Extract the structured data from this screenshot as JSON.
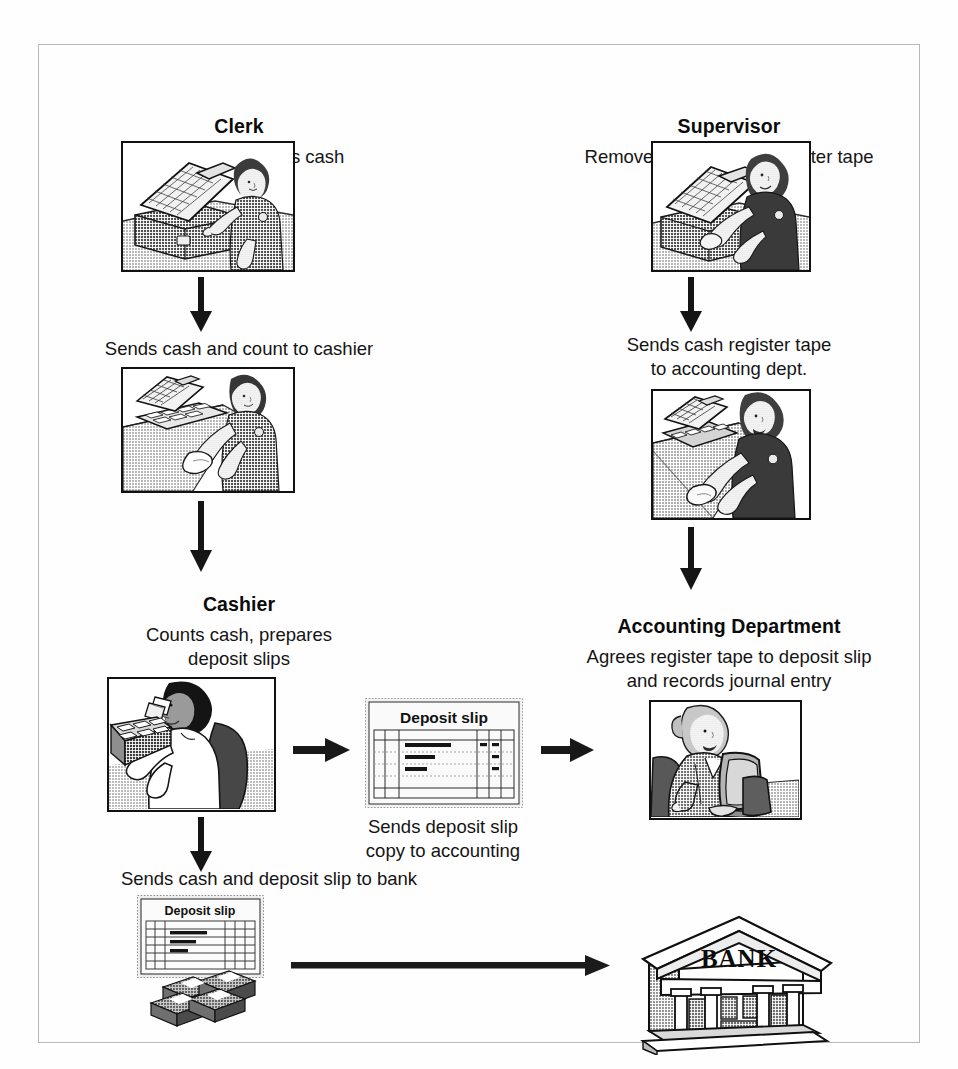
{
  "diagram": {
    "border_color": "#b8b8b8",
    "ink_color": "#0d0d0d",
    "background": "#fefefe"
  },
  "columns": {
    "clerk": {
      "role": "Clerk",
      "duty": "Enters sales, counts cash",
      "step_caption": "Sends cash and count to cashier",
      "image_1_name": "clerk-at-cash-register",
      "image_2_name": "clerk-handing-cash-to-cashier"
    },
    "supervisor": {
      "role": "Supervisor",
      "duty": "Removes locked cash register tape",
      "step_caption_line1": "Sends cash register tape",
      "step_caption_line2": "to accounting dept.",
      "image_1_name": "supervisor-removing-register-tape",
      "image_2_name": "supervisor-sending-register-tape"
    },
    "cashier": {
      "role": "Cashier",
      "duty_line1": "Counts cash, prepares",
      "duty_line2": "deposit slips",
      "image_name": "cashier-counting-cash",
      "step_caption_line1": "Sends deposit slip",
      "step_caption_line2": "copy to accounting",
      "bank_caption": "Sends cash and deposit slip to bank"
    },
    "accounting": {
      "role": "Accounting Department",
      "duty_line1": "Agrees register tape to deposit slip",
      "duty_line2": "and records journal entry",
      "image_name": "accountant-at-computer"
    }
  },
  "artifacts": {
    "deposit_slip_label": "Deposit slip",
    "deposit_slip_copy_label": "Deposit slip",
    "bank_label": "BANK"
  },
  "arrows": {
    "clerk_down_1": "arrow-down",
    "clerk_down_2": "arrow-down",
    "supervisor_down_1": "arrow-down",
    "supervisor_down_2": "arrow-down",
    "cashier_to_slip": "arrow-right",
    "slip_to_accounting": "arrow-right",
    "cashier_down_to_bank_slip": "arrow-down",
    "bank_slip_to_bank": "arrow-right-long"
  }
}
